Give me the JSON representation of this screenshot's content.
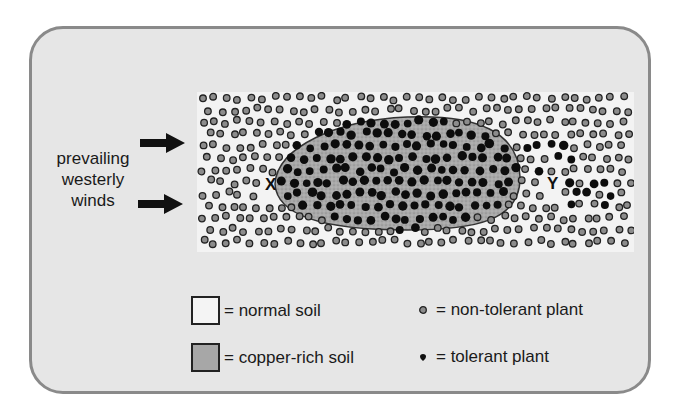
{
  "diagram": {
    "wind_label": [
      "prevailing",
      "westerly",
      "winds"
    ],
    "markers": {
      "x": "X",
      "y": "Y"
    },
    "seed": 7,
    "colors": {
      "frame_bg": "#e6e6e6",
      "frame_border": "#8a8a8a",
      "normal_soil": "#f3f3f3",
      "copper_soil": "#a7a7a7",
      "non_tolerant_fill": "#8c8c8c",
      "tolerant_fill": "#0d0d0d"
    }
  },
  "legend": {
    "items": [
      {
        "symbol": "white-square",
        "label": "= normal soil"
      },
      {
        "symbol": "grey-square",
        "label": "= copper-rich soil"
      },
      {
        "symbol": "grey-ring-dot",
        "label": "= non-tolerant plant"
      },
      {
        "symbol": "black-dot",
        "label": "= tolerant plant"
      }
    ]
  }
}
